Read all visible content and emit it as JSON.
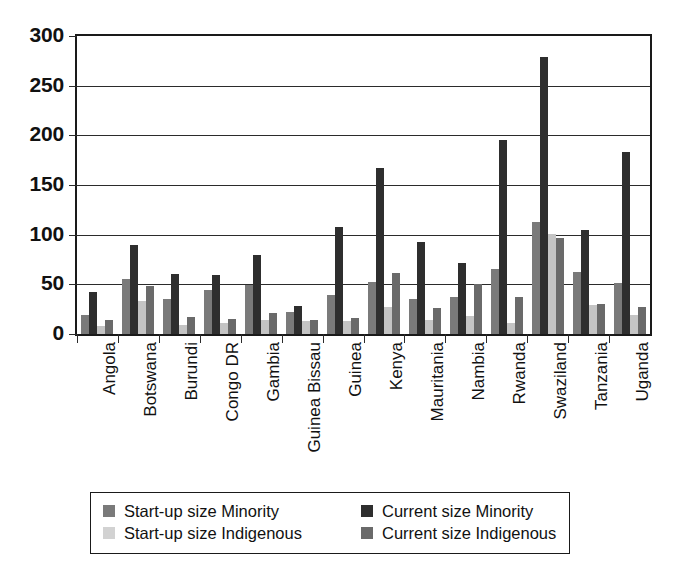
{
  "chart_data": {
    "type": "bar",
    "title": "",
    "subtitle": "",
    "xlabel": "",
    "ylabel": "",
    "ylim": [
      0,
      300
    ],
    "y_ticks": [
      0,
      50,
      100,
      150,
      200,
      250,
      300
    ],
    "grid": true,
    "legend_position": "bottom",
    "categories": [
      "Angola",
      "Botswana",
      "Burundi",
      "Congo DR",
      "Gambia",
      "Guinea Bissau",
      "Guinea",
      "Kenya",
      "Mauritania",
      "Nambia",
      "Rwanda",
      "Swaziland",
      "Tanzania",
      "Uganda"
    ],
    "series": [
      {
        "name": "Start-up size Minority",
        "color": "#7a7a7a",
        "values": [
          19,
          55,
          35,
          44,
          49,
          22,
          39,
          52,
          35,
          37,
          65,
          113,
          62,
          51
        ]
      },
      {
        "name": "Current size Minority",
        "color": "#2e2e2e",
        "values": [
          42,
          90,
          60,
          59,
          80,
          28,
          108,
          167,
          93,
          71,
          195,
          279,
          105,
          183
        ]
      },
      {
        "name": "Start-up size Indigenous",
        "color": "#d2d2d2",
        "values": [
          8,
          33,
          9,
          11,
          14,
          13,
          13,
          27,
          14,
          18,
          11,
          101,
          29,
          19
        ]
      },
      {
        "name": "Current size Indigenous",
        "color": "#6a6a6a",
        "values": [
          14,
          48,
          17,
          15,
          21,
          14,
          16,
          61,
          26,
          50,
          37,
          97,
          30,
          27
        ]
      }
    ]
  },
  "legend": {
    "items": [
      "Start-up size Minority",
      "Current size Minority",
      "Start-up size Indigenous",
      "Current size Indigenous"
    ]
  }
}
